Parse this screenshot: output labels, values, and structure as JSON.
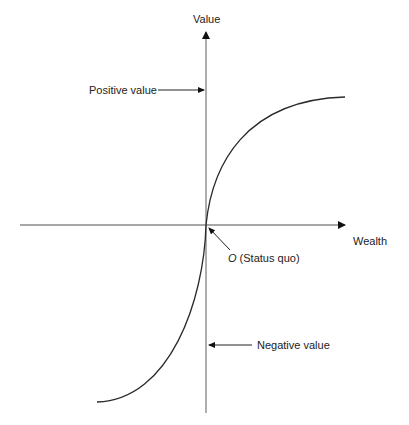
{
  "diagram": {
    "type": "value-function",
    "y_axis_label": "Value",
    "x_axis_label": "Wealth",
    "origin_label_letter": "O",
    "origin_label_text": " (Status quo)",
    "positive_annotation": "Positive value",
    "negative_annotation": "Negative value",
    "colors": {
      "axis": "#8a8a8a",
      "curve": "#2a2a2a",
      "text": "#222222",
      "background": "#ffffff"
    }
  }
}
